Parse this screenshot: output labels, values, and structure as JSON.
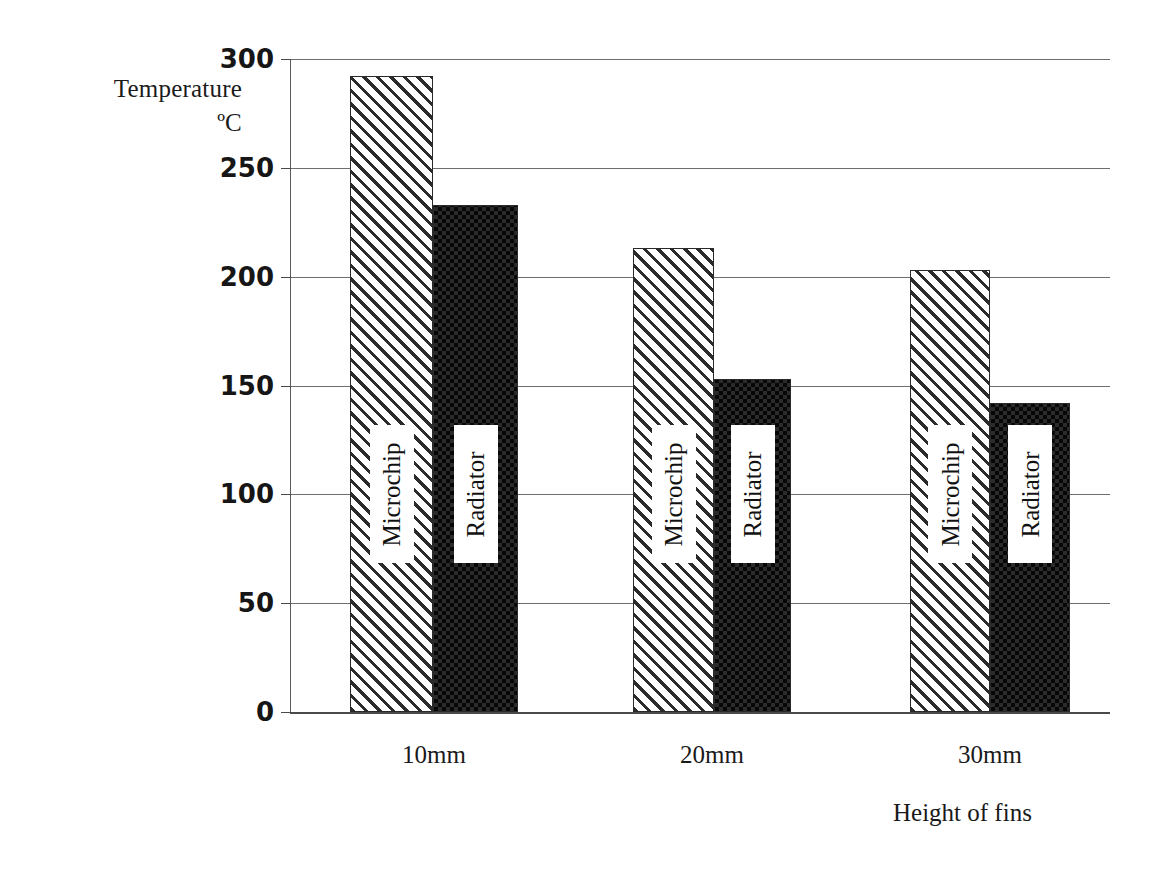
{
  "chart_data": {
    "type": "bar",
    "title": "",
    "xlabel": "Height of fins",
    "ylabel": "Temperature °C",
    "ylabel_lines": [
      "Temperature",
      "ºC"
    ],
    "categories": [
      "10mm",
      "20mm",
      "30mm"
    ],
    "series": [
      {
        "name": "Microchip",
        "values": [
          292,
          213,
          203
        ],
        "pattern": "diagonal-hatch"
      },
      {
        "name": "Radiator",
        "values": [
          233,
          153,
          142
        ],
        "pattern": "checkerboard"
      }
    ],
    "ylim": [
      0,
      300
    ],
    "yticks": [
      0,
      50,
      100,
      150,
      200,
      250,
      300
    ],
    "ytick_labels": [
      "0",
      "50",
      "100",
      "150",
      "200",
      "250",
      "300"
    ],
    "grid": true,
    "legend": "in-bar",
    "colors": {
      "ink": "#2b2b2b",
      "gridline": "#6e6e6e",
      "background": "#ffffff"
    }
  },
  "axis": {
    "y_title_line1": "Temperature",
    "y_title_line2": "ºC",
    "x_title": "Height of fins"
  }
}
